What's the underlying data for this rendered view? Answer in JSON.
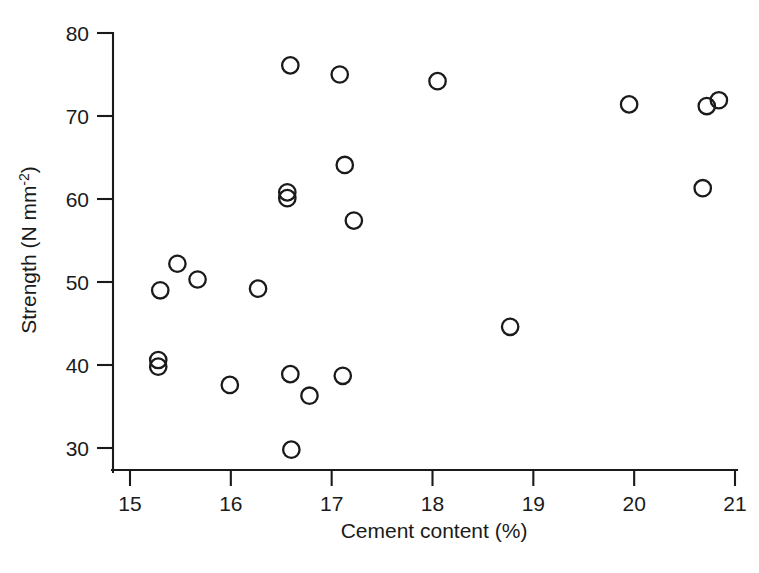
{
  "chart_data": {
    "type": "scatter",
    "title": "",
    "xlabel": "Cement content (%)",
    "ylabel": "Strength (N mm",
    "ylabel_sup": "-2",
    "ylabel_suffix": ")",
    "ylabel_full": "Strength (N mm⁻²)",
    "xlim": [
      15,
      21
    ],
    "ylim": [
      30,
      80
    ],
    "xticks": [
      15,
      16,
      17,
      18,
      19,
      20,
      21
    ],
    "xtick_labels": [
      "15",
      "16",
      "17",
      "18",
      "19",
      "20",
      "21"
    ],
    "yticks": [
      30,
      40,
      50,
      60,
      70,
      80
    ],
    "ytick_labels": [
      "30",
      "40",
      "50",
      "60",
      "70",
      "80"
    ],
    "grid": false,
    "legend": null,
    "marker": "open-circle",
    "marker_color": "#1a1a1a",
    "n_points": 24,
    "x": [
      15.28,
      15.28,
      15.3,
      15.47,
      15.67,
      15.99,
      16.27,
      16.56,
      16.56,
      16.59,
      16.59,
      16.6,
      16.78,
      17.08,
      17.11,
      17.13,
      17.22,
      18.05,
      18.77,
      19.95,
      20.68,
      20.72,
      20.8,
      20.88
    ],
    "y": [
      40.6,
      39.8,
      49.0,
      52.2,
      50.3,
      37.6,
      49.2,
      60.8,
      60.1,
      76.1,
      38.9,
      29.8,
      36.3,
      75.0,
      38.7,
      64.1,
      57.4,
      74.2,
      44.6,
      71.4,
      61.3,
      71.2,
      71.9,
      71.9
    ],
    "points": [
      {
        "x": 15.28,
        "y": 40.6
      },
      {
        "x": 15.28,
        "y": 39.8
      },
      {
        "x": 15.3,
        "y": 49.0
      },
      {
        "x": 15.47,
        "y": 52.2
      },
      {
        "x": 15.67,
        "y": 50.3
      },
      {
        "x": 15.99,
        "y": 37.6
      },
      {
        "x": 16.27,
        "y": 49.2
      },
      {
        "x": 16.56,
        "y": 60.8
      },
      {
        "x": 16.56,
        "y": 60.1
      },
      {
        "x": 16.59,
        "y": 76.1
      },
      {
        "x": 16.59,
        "y": 38.9
      },
      {
        "x": 16.6,
        "y": 29.8
      },
      {
        "x": 16.78,
        "y": 36.3
      },
      {
        "x": 17.08,
        "y": 75.0
      },
      {
        "x": 17.11,
        "y": 38.7
      },
      {
        "x": 17.13,
        "y": 64.1
      },
      {
        "x": 17.22,
        "y": 57.4
      },
      {
        "x": 18.05,
        "y": 74.2
      },
      {
        "x": 18.77,
        "y": 44.6
      },
      {
        "x": 19.95,
        "y": 71.4
      },
      {
        "x": 20.68,
        "y": 61.3
      },
      {
        "x": 20.72,
        "y": 71.2
      },
      {
        "x": 20.84,
        "y": 71.9
      }
    ]
  }
}
